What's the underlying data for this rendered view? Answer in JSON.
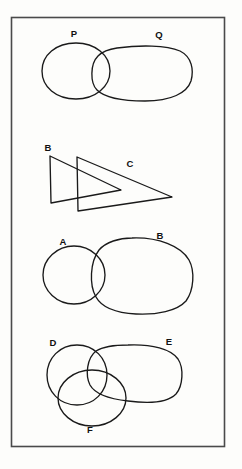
{
  "figure": {
    "background_color": "#fdfdfb",
    "stroke_color": "#1a1a1a",
    "border_color": "#4a4a4a",
    "frame": {
      "x": 11,
      "y": 17,
      "width": 214,
      "height": 430
    },
    "panels": [
      {
        "id": "panel-1",
        "name": "panel-p-q",
        "description": "two overlapping closed curves",
        "labels": [
          {
            "text": "P",
            "x": 74,
            "y": 37
          },
          {
            "text": "Q",
            "x": 159,
            "y": 38
          }
        ],
        "shapes": [
          {
            "name": "shape-p",
            "type": "circle",
            "cx": 76,
            "cy": 71,
            "rx": 34,
            "ry": 28
          },
          {
            "name": "shape-q",
            "type": "oval",
            "cx": 143,
            "cy": 74,
            "rx": 50,
            "ry": 27
          }
        ]
      },
      {
        "id": "panel-2",
        "name": "panel-b-c",
        "description": "two overlapping triangles",
        "labels": [
          {
            "text": "B",
            "x": 48,
            "y": 151
          },
          {
            "text": "C",
            "x": 130,
            "y": 167
          }
        ],
        "shapes": [
          {
            "name": "shape-b",
            "type": "triangle",
            "points": "50,156 121,190 51,203"
          },
          {
            "name": "shape-c",
            "type": "triangle",
            "points": "77,157 172,197 78,211"
          }
        ]
      },
      {
        "id": "panel-3",
        "name": "panel-a-b",
        "description": "two overlapping closed curves",
        "labels": [
          {
            "text": "A",
            "x": 63,
            "y": 245
          },
          {
            "text": "B",
            "x": 160,
            "y": 239
          }
        ],
        "shapes": [
          {
            "name": "shape-a",
            "type": "circle",
            "cx": 74,
            "cy": 275,
            "rx": 31,
            "ry": 29
          },
          {
            "name": "shape-b2",
            "type": "oval",
            "cx": 143,
            "cy": 276,
            "rx": 49,
            "ry": 38
          }
        ]
      },
      {
        "id": "panel-4",
        "name": "panel-d-e-f",
        "description": "three overlapping closed curves",
        "labels": [
          {
            "text": "D",
            "x": 53,
            "y": 346
          },
          {
            "text": "E",
            "x": 169,
            "y": 345
          },
          {
            "text": "F",
            "x": 90,
            "y": 433
          }
        ],
        "shapes": [
          {
            "name": "shape-d",
            "type": "circle",
            "cx": 77,
            "cy": 375,
            "rx": 30,
            "ry": 30
          },
          {
            "name": "shape-e",
            "type": "oval",
            "cx": 135,
            "cy": 372,
            "rx": 45,
            "ry": 28
          },
          {
            "name": "shape-f",
            "type": "circle",
            "cx": 92,
            "cy": 398,
            "rx": 34,
            "ry": 28
          }
        ]
      }
    ]
  }
}
